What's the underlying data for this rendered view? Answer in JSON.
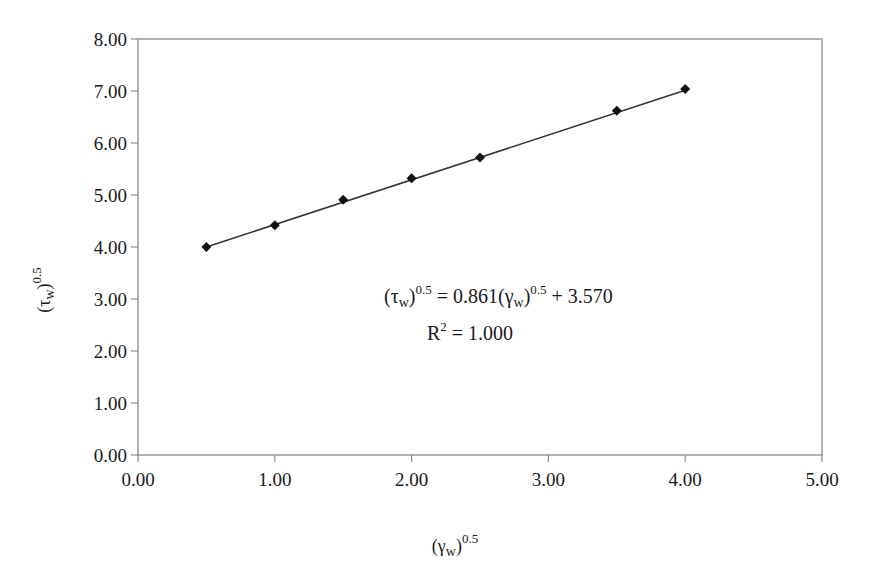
{
  "chart_data": {
    "type": "scatter",
    "title": "",
    "xlabel": "(γw)^0.5",
    "ylabel": "(τw)^0.5",
    "xlim": [
      0,
      5
    ],
    "ylim": [
      0,
      8
    ],
    "x_ticks": [
      "0.00",
      "1.00",
      "2.00",
      "3.00",
      "4.00",
      "5.00"
    ],
    "y_ticks": [
      "0.00",
      "1.00",
      "2.00",
      "3.00",
      "4.00",
      "5.00",
      "6.00",
      "7.00",
      "8.00"
    ],
    "grid": false,
    "legend": "none",
    "series": [
      {
        "name": "data",
        "marker": "diamond",
        "x": [
          0.5,
          1.0,
          1.5,
          2.0,
          2.5,
          3.5,
          4.0
        ],
        "y": [
          4.0,
          4.42,
          4.91,
          5.32,
          5.72,
          6.62,
          7.04
        ]
      }
    ],
    "trendline": {
      "type": "linear",
      "slope": 0.861,
      "intercept": 3.57,
      "r_squared": 1.0,
      "x_range": [
        0.5,
        4.0
      ]
    },
    "annotations": [
      "(τw)^0.5 = 0.861(γw)^0.5 + 3.570",
      "R^2 = 1.000"
    ]
  },
  "axis": {
    "x_title_base": "(γ",
    "x_title_sub": "w",
    "x_title_close": ")",
    "x_title_sup": "0.5",
    "y_title_base": "(τ",
    "y_title_sub": "w",
    "y_title_close": ")",
    "y_title_sup": "0.5"
  },
  "equation": {
    "lhs_base": "(τ",
    "lhs_sub": "w",
    "lhs_close": ")",
    "lhs_sup": "0.5",
    "mid": " = 0.861(γ",
    "rhs_sub": "w",
    "rhs_close": ")",
    "rhs_sup": "0.5",
    "tail": " + 3.570",
    "r2_base": "R",
    "r2_sup": "2",
    "r2_tail": " = 1.000"
  },
  "colors": {
    "axis": "#8a8a8a",
    "line": "#333333",
    "marker": "#111111",
    "text": "#1a1a1a"
  }
}
